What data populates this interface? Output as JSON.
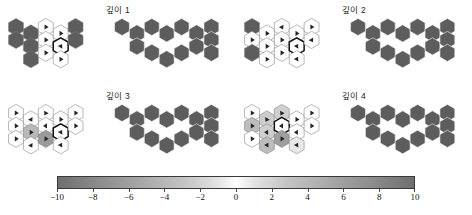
{
  "figure": {
    "background": "#ffffff",
    "panel_titles": [
      "깊이 1",
      "깊이 2",
      "깊이 3",
      "깊이 4"
    ]
  },
  "colorbar": {
    "name": "value-colorbar",
    "orientation": "horizontal",
    "vmin": -10,
    "vmax": 10,
    "tick_labels": [
      "-10",
      "-8",
      "-6",
      "-4",
      "-2",
      "0",
      "2",
      "4",
      "6",
      "8",
      "10"
    ],
    "tick_values": [
      -10,
      -8,
      -6,
      -4,
      -2,
      0,
      2,
      4,
      6,
      8,
      10
    ],
    "colormap": "diverging-gray (dark at extremes, white at 0)",
    "color_min": "#6f6f6f",
    "color_mid": "#ffffff",
    "color_max": "#6f6f6f"
  },
  "chart_data": {
    "type": "heatmap",
    "title": "",
    "subtitle": "",
    "xlabel": "",
    "ylabel": "",
    "grid": false,
    "legend_position": "bottom",
    "colorbar": {
      "vmin": -10,
      "vmax": 10,
      "ticks": [
        -10,
        -8,
        -6,
        -4,
        -2,
        0,
        2,
        4,
        6,
        8,
        10
      ]
    },
    "panels": [
      {
        "title": "깊이 1",
        "left_grid": {
          "name": "policy-value-hexgrid",
          "description": "hexagonal value grid with policy arrows; highlighted agent cell outlined bold",
          "cells": [
            {
              "col": 0,
              "row": 0,
              "value": -9,
              "fill": "#5d5d5d",
              "arrow": null
            },
            {
              "col": 0,
              "row": 1,
              "value": -9,
              "fill": "#5d5d5d",
              "arrow": null
            },
            {
              "col": 1,
              "row": 0,
              "value": -9,
              "fill": "#5d5d5d",
              "arrow": null
            },
            {
              "col": 1,
              "row": 1,
              "value": -9,
              "fill": "#5d5d5d",
              "arrow": null
            },
            {
              "col": 1,
              "row": 2,
              "value": -9,
              "fill": "#5d5d5d",
              "arrow": null
            },
            {
              "col": 2,
              "row": 0,
              "value": 0,
              "fill": "#ffffff",
              "arrow": "right"
            },
            {
              "col": 2,
              "row": 1,
              "value": 0,
              "fill": "#ffffff",
              "arrow": "right"
            },
            {
              "col": 2,
              "row": 2,
              "value": 0,
              "fill": "#ffffff",
              "arrow": "right"
            },
            {
              "col": 3,
              "row": 0,
              "value": 0,
              "fill": "#ffffff",
              "arrow": "right"
            },
            {
              "col": 3,
              "row": 1,
              "value": 0,
              "fill": "#ffffff",
              "arrow": "up-right",
              "highlight": true
            },
            {
              "col": 3,
              "row": 2,
              "value": 0,
              "fill": "#ffffff",
              "arrow": "right"
            },
            {
              "col": 4,
              "row": 0,
              "value": -9,
              "fill": "#5d5d5d",
              "arrow": null
            },
            {
              "col": 4,
              "row": 1,
              "value": -9,
              "fill": "#5d5d5d",
              "arrow": null
            }
          ]
        },
        "right_grid": {
          "name": "board-hexgrid",
          "description": "maze/board layout of uniform dark hexes",
          "fill": "#5d5d5d"
        }
      },
      {
        "title": "깊이 2",
        "left_grid": {
          "name": "policy-value-hexgrid",
          "cells": [
            {
              "col": 0,
              "row": 0,
              "value": -9,
              "fill": "#5d5d5d",
              "arrow": null
            },
            {
              "col": 0,
              "row": 1,
              "value": 0,
              "fill": "#ffffff",
              "arrow": "right"
            },
            {
              "col": 0,
              "row": 2,
              "value": -9,
              "fill": "#5d5d5d",
              "arrow": null
            },
            {
              "col": 1,
              "row": 0,
              "value": 0,
              "fill": "#ffffff",
              "arrow": "right"
            },
            {
              "col": 1,
              "row": 1,
              "value": 0,
              "fill": "#ffffff",
              "arrow": "right"
            },
            {
              "col": 1,
              "row": 2,
              "value": 0,
              "fill": "#ffffff",
              "arrow": "right"
            },
            {
              "col": 2,
              "row": 0,
              "value": 0,
              "fill": "#ffffff",
              "arrow": "down-right"
            },
            {
              "col": 2,
              "row": 1,
              "value": 0,
              "fill": "#ffffff",
              "arrow": "right"
            },
            {
              "col": 2,
              "row": 2,
              "value": 0,
              "fill": "#ffffff",
              "arrow": "right"
            },
            {
              "col": 3,
              "row": 0,
              "value": 0,
              "fill": "#ffffff",
              "arrow": "right"
            },
            {
              "col": 3,
              "row": 1,
              "value": 0,
              "fill": "#ffffff",
              "arrow": "up-right",
              "highlight": true
            },
            {
              "col": 3,
              "row": 2,
              "value": 0,
              "fill": "#ffffff",
              "arrow": "up-right"
            },
            {
              "col": 4,
              "row": 0,
              "value": 0,
              "fill": "#ffffff",
              "arrow": "right"
            },
            {
              "col": 4,
              "row": 1,
              "value": 0,
              "fill": "#ffffff",
              "arrow": "down-right"
            }
          ]
        },
        "right_grid": {
          "name": "board-hexgrid",
          "fill": "#5d5d5d"
        }
      },
      {
        "title": "깊이 3",
        "left_grid": {
          "name": "policy-value-hexgrid",
          "cells": [
            {
              "col": 0,
              "row": 0,
              "value": 0,
              "fill": "#ffffff",
              "arrow": "right"
            },
            {
              "col": 0,
              "row": 1,
              "value": 0,
              "fill": "#ffffff",
              "arrow": "right"
            },
            {
              "col": 0,
              "row": 2,
              "value": 0,
              "fill": "#ffffff",
              "arrow": "right"
            },
            {
              "col": 1,
              "row": 0,
              "value": 0,
              "fill": "#ffffff",
              "arrow": "down-right"
            },
            {
              "col": 1,
              "row": 1,
              "value": -3,
              "fill": "#b9b9b9",
              "arrow": "right"
            },
            {
              "col": 1,
              "row": 2,
              "value": 0,
              "fill": "#ffffff",
              "arrow": "down-right"
            },
            {
              "col": 2,
              "row": 0,
              "value": 0,
              "fill": "#ffffff",
              "arrow": "down-left"
            },
            {
              "col": 2,
              "row": 1,
              "value": 0,
              "fill": "#ffffff",
              "arrow": "left"
            },
            {
              "col": 2,
              "row": 2,
              "value": -5,
              "fill": "#9b9b9b",
              "arrow": "right"
            },
            {
              "col": 3,
              "row": 0,
              "value": 0,
              "fill": "#ffffff",
              "arrow": "right"
            },
            {
              "col": 3,
              "row": 1,
              "value": 0,
              "fill": "#ffffff",
              "arrow": "up-right",
              "highlight": true
            },
            {
              "col": 3,
              "row": 2,
              "value": 0,
              "fill": "#ffffff",
              "arrow": "up-right"
            },
            {
              "col": 4,
              "row": 0,
              "value": 0,
              "fill": "#ffffff",
              "arrow": "right"
            },
            {
              "col": 4,
              "row": 1,
              "value": 0,
              "fill": "#ffffff",
              "arrow": "right"
            }
          ]
        },
        "right_grid": {
          "name": "board-hexgrid",
          "fill": "#5d5d5d"
        }
      },
      {
        "title": "깊이 4",
        "left_grid": {
          "name": "policy-value-hexgrid",
          "cells": [
            {
              "col": 0,
              "row": 0,
              "value": 0,
              "fill": "#ffffff",
              "arrow": "right"
            },
            {
              "col": 0,
              "row": 1,
              "value": -3,
              "fill": "#bdbdbd",
              "arrow": "right"
            },
            {
              "col": 0,
              "row": 2,
              "value": 0,
              "fill": "#ffffff",
              "arrow": "right"
            },
            {
              "col": 1,
              "row": 0,
              "value": -2,
              "fill": "#cccccc",
              "arrow": "down-left"
            },
            {
              "col": 1,
              "row": 1,
              "value": -2,
              "fill": "#cfcfcf",
              "arrow": "left"
            },
            {
              "col": 1,
              "row": 2,
              "value": -3,
              "fill": "#bdbdbd",
              "arrow": "up-right"
            },
            {
              "col": 2,
              "row": 0,
              "value": -2,
              "fill": "#cfcfcf",
              "arrow": "down-left"
            },
            {
              "col": 2,
              "row": 1,
              "value": 0,
              "fill": "#ffffff",
              "arrow": "left",
              "highlight": true
            },
            {
              "col": 2,
              "row": 2,
              "value": -5,
              "fill": "#9e9e9e",
              "arrow": "right"
            },
            {
              "col": 3,
              "row": 0,
              "value": 0,
              "fill": "#ffffff",
              "arrow": "right"
            },
            {
              "col": 3,
              "row": 1,
              "value": 0,
              "fill": "#ffffff",
              "arrow": "left"
            },
            {
              "col": 3,
              "row": 2,
              "value": -1,
              "fill": "#e8e8e8",
              "arrow": "up-right"
            },
            {
              "col": 4,
              "row": 0,
              "value": 0,
              "fill": "#ffffff",
              "arrow": "right"
            },
            {
              "col": 4,
              "row": 1,
              "value": 0,
              "fill": "#ffffff",
              "arrow": "right"
            }
          ]
        },
        "right_grid": {
          "name": "board-hexgrid",
          "fill": "#5d5d5d"
        }
      }
    ]
  }
}
